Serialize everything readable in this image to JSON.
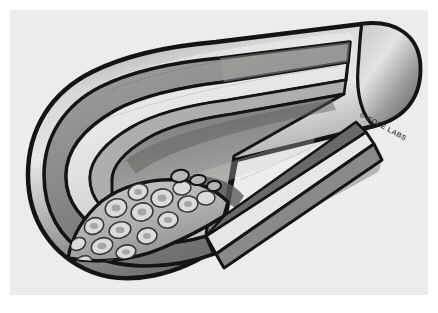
{
  "figure": {
    "signature": "© COLE LABS",
    "background_color": "#efefee",
    "page_background_color": "#ffffff",
    "ink_color": "#1a1a1a"
  },
  "anatomy": {
    "layers": [
      {
        "name": "adventitia",
        "label": "Adventitia (outer coat)",
        "color": "#8f8f8f"
      },
      {
        "name": "media",
        "label": "Media (smooth muscle)",
        "color": "#e8e8e6"
      },
      {
        "name": "intima",
        "label": "Intima (inner lining)",
        "color": "#6e6e6e"
      },
      {
        "name": "lumen",
        "label": "Lumen (blood channel)",
        "color": "#9a9a9a"
      },
      {
        "name": "plaque",
        "label": "Atherosclerotic plaque",
        "color": "#b9b9b7"
      }
    ],
    "plaque": {
      "label": "Lipid / foam cell deposit",
      "cell_count": 16,
      "cell_fill": "#d8d8d6",
      "cell_outline": "#3a3a3a"
    },
    "vessel": {
      "label": "Artery (longitudinal cutaway)",
      "outer_color_light": "#d6d6d4",
      "outer_color_dark": "#6a6a6a",
      "outline_color": "#141414"
    }
  },
  "colors": {
    "ink": "#141414",
    "paper": "#efefee",
    "mid_gray": "#9a9a9a",
    "light_gray": "#dcdcda",
    "dark_gray": "#5a5a5a"
  }
}
